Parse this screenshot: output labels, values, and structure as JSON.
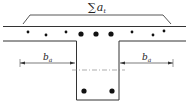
{
  "diagram": {
    "type": "T-beam cross-section reinforcement",
    "labels": {
      "sum_symbol": "∑",
      "sum_var": "a",
      "sum_sub": "t",
      "left_width_var": "b",
      "left_width_sub": "a",
      "right_width_var": "b",
      "right_width_sub": "a"
    },
    "colors": {
      "line": "#333333",
      "bar": "#111111",
      "background": "#ffffff"
    },
    "flange_bars_small": [
      {
        "x": 28,
        "y": 32
      },
      {
        "x": 46,
        "y": 35
      },
      {
        "x": 66,
        "y": 32
      },
      {
        "x": 132,
        "y": 32
      },
      {
        "x": 153,
        "y": 35
      },
      {
        "x": 164,
        "y": 31
      }
    ],
    "flange_bars_large": [
      {
        "x": 81,
        "y": 34
      },
      {
        "x": 96,
        "y": 34
      },
      {
        "x": 111,
        "y": 34
      }
    ],
    "web_bars": [
      {
        "x": 84,
        "y": 91
      },
      {
        "x": 112,
        "y": 91
      }
    ]
  }
}
